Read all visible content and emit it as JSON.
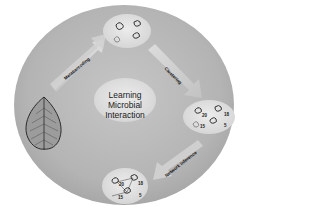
{
  "diagram": {
    "center_title_lines": [
      "Learning",
      "Microbial",
      "Interaction"
    ],
    "steps": [
      {
        "id": "metabarcoding",
        "label": "Metabarcoding"
      },
      {
        "id": "clustering",
        "label": "Clustering"
      },
      {
        "id": "network_inference",
        "label": "Network inference"
      }
    ],
    "nodes": {
      "source": "leaf",
      "sequenced_microbes": "microbe-community",
      "clustered_otus": {
        "counts": [
          "20",
          "18",
          "15",
          "5"
        ]
      },
      "inferred_network": {
        "counts": [
          "20",
          "18",
          "15",
          "5"
        ]
      }
    },
    "colors": {
      "background_circle": "#b8b8b8",
      "inner_ellipse": "#e2e2e2",
      "arrow": "#d6d6d6",
      "leaf_fill": "#9a9a9a",
      "leaf_stroke": "#333333",
      "page_background": "#ffffff"
    }
  }
}
